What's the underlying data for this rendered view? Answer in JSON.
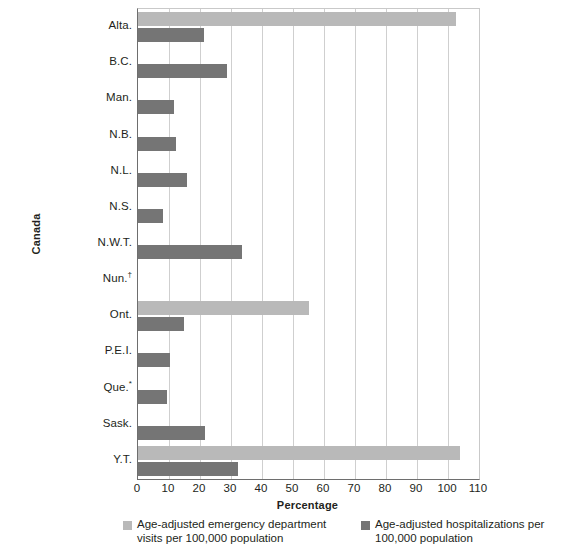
{
  "chart_data": {
    "type": "bar",
    "orientation": "horizontal",
    "title": "",
    "xlabel": "Percentage",
    "ylabel": "Canada",
    "xlim": [
      0,
      110
    ],
    "xticks": [
      0,
      10,
      20,
      30,
      40,
      50,
      60,
      70,
      80,
      90,
      100,
      110
    ],
    "grid": "vertical",
    "legend_position": "bottom",
    "categories": [
      "Alta.",
      "B.C.",
      "Man.",
      "N.B.",
      "N.L.",
      "N.S.",
      "N.W.T.",
      "Nun.",
      "Ont.",
      "P.E.I.",
      "Que.",
      "Sask.",
      "Y.T."
    ],
    "category_marks": [
      "",
      "",
      "",
      "",
      "",
      "",
      "",
      "†",
      "",
      "",
      "*",
      "",
      ""
    ],
    "series": [
      {
        "name": "Age-adjusted emergency department visits per 100,000 population",
        "color": "#b9b9b9",
        "values": [
          102.5,
          null,
          null,
          null,
          null,
          null,
          null,
          null,
          55.0,
          null,
          null,
          null,
          104.0
        ]
      },
      {
        "name": "Age-adjusted hospitalizations per 100,000 population",
        "color": "#757575",
        "values": [
          21.3,
          28.7,
          11.6,
          12.3,
          15.8,
          8.0,
          33.5,
          null,
          14.8,
          10.3,
          9.4,
          21.6,
          32.3
        ]
      }
    ]
  },
  "axis": {
    "y_title": "Canada",
    "x_title": "Percentage"
  },
  "legend": {
    "items": [
      {
        "swatch": "ed",
        "label": "Age-adjusted emergency department visits per 100,000 population"
      },
      {
        "swatch": "hosp",
        "label": "Age-adjusted hospitalizations per 100,000 population"
      }
    ]
  }
}
